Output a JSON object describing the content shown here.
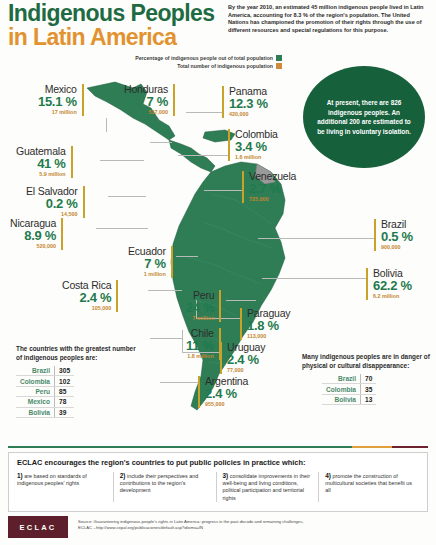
{
  "title": {
    "line1": "Indigenous Peoples",
    "line2": "in Latin America"
  },
  "intro": "By the year 2010, an estimated 45 million indigenous people lived in Latin America, accounting for 8.3 % of the region's population. The United Nations has championed the promotion of their rights through the use of different resources and special regulations for this purpose.",
  "legend": [
    {
      "label": "Percentage of indigenous people out of total population",
      "color": "#2e7d55"
    },
    {
      "label": "Total number of indigenous population",
      "color": "#d08a3a"
    }
  ],
  "circle_note": "At present, there are 826 indigenous peoples. An additional 200 are estimated to be living in voluntary isolation.",
  "countries": [
    {
      "name": "Mexico",
      "pct": "15.1 %",
      "total": "17 million"
    },
    {
      "name": "Honduras",
      "pct": "7 %",
      "total": "537,000"
    },
    {
      "name": "Panama",
      "pct": "12.3 %",
      "total": "420,000"
    },
    {
      "name": "Colombia",
      "pct": "3.4 %",
      "total": "1.6 million"
    },
    {
      "name": "Guatemala",
      "pct": "41 %",
      "total": "5.9 million"
    },
    {
      "name": "Venezuela",
      "pct": "2.7 %",
      "total": "725,000"
    },
    {
      "name": "El Salvador",
      "pct": "0.2 %",
      "total": "14,500"
    },
    {
      "name": "Nicaragua",
      "pct": "8.9 %",
      "total": "520,000"
    },
    {
      "name": "Brazil",
      "pct": "0.5 %",
      "total": "900,000"
    },
    {
      "name": "Ecuador",
      "pct": "7 %",
      "total": "1 million"
    },
    {
      "name": "Bolivia",
      "pct": "62.2 %",
      "total": "6.2 million"
    },
    {
      "name": "Costa Rica",
      "pct": "2.4 %",
      "total": "105,000"
    },
    {
      "name": "Peru",
      "pct": "24 %",
      "total": "7 million"
    },
    {
      "name": "Paraguay",
      "pct": "1.8 %",
      "total": "113,000"
    },
    {
      "name": "Chile",
      "pct": "11 %",
      "total": "1.8 million"
    },
    {
      "name": "Uruguay",
      "pct": "2.4 %",
      "total": "77,000"
    },
    {
      "name": "Argentina",
      "pct": "2.4 %",
      "total": "955,000"
    }
  ],
  "greatest": {
    "heading": "The countries with the greatest number of indigenous peoples are:",
    "rows": [
      {
        "country": "Brazil",
        "value": "305"
      },
      {
        "country": "Colombia",
        "value": "102"
      },
      {
        "country": "Peru",
        "value": "85"
      },
      {
        "country": "Mexico",
        "value": "78"
      },
      {
        "country": "Bolivia",
        "value": "39"
      }
    ]
  },
  "danger": {
    "heading": "Many indigenous peoples are in danger of physical or cultural disappearance:",
    "rows": [
      {
        "country": "Brazil",
        "value": "70"
      },
      {
        "country": "Colombia",
        "value": "35"
      },
      {
        "country": "Bolivia",
        "value": "13"
      }
    ]
  },
  "footer": {
    "title": "ECLAC encourages the region's countries to put public policies in practice which:",
    "items": [
      {
        "num": "1)",
        "text": "are based on standards of indigenous peoples' rights"
      },
      {
        "num": "2)",
        "text": "include their perspectives and contributions to the region's development"
      },
      {
        "num": "3)",
        "text": "consolidate improvements in their well-being and living conditions, political participation and territorial rights"
      },
      {
        "num": "4)",
        "text": "promote the construction of multicultural societies that benefit us all"
      }
    ],
    "logo": "ECLAC",
    "source_line1": "Source: Guaranteeing indigenous people's rights in Latin America: progress in the past decade and remaining challenges,",
    "source_line2": "ECLAC --http://www.cepal.org/publicaciones/default.asp?idioma=IN"
  }
}
